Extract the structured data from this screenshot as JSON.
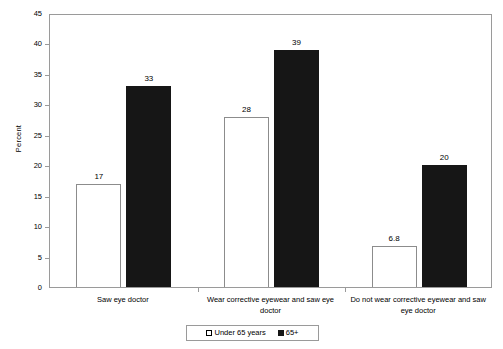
{
  "chart_data": {
    "type": "bar",
    "title": "",
    "xlabel": "",
    "ylabel": "Percent",
    "ylim": [
      0,
      45
    ],
    "ytick_step": 5,
    "yticks": [
      "0",
      "5",
      "10",
      "15",
      "20",
      "25",
      "30",
      "35",
      "40",
      "45"
    ],
    "grid": false,
    "legend_position": "bottom-center",
    "categories": [
      "Saw eye doctor",
      "Wear corrective eyewear and saw eye doctor",
      "Do not wear corrective eyewear and saw eye doctor"
    ],
    "series": [
      {
        "name": "Under  65 years",
        "color": "#ffffff",
        "edgecolor": "#8c8c8c",
        "values": [
          17,
          28,
          6.8
        ],
        "labels": [
          "17",
          "28",
          "6.8"
        ]
      },
      {
        "name": "65+",
        "color": "#161616",
        "edgecolor": "#161616",
        "values": [
          33,
          39,
          20
        ],
        "labels": [
          "33",
          "39",
          "20"
        ]
      }
    ]
  },
  "axis": {
    "y_title": "Percent"
  },
  "legend": {
    "entries": [
      {
        "label": "Under  65 years",
        "swatch": "white-square-icon"
      },
      {
        "label": "65+",
        "swatch": "black-square-icon"
      }
    ]
  }
}
